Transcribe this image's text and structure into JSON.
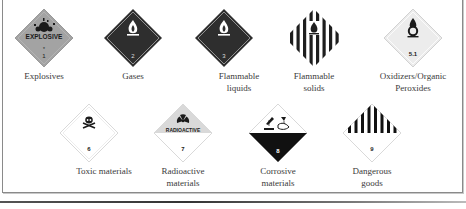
{
  "signs": [
    {
      "label": "Explosives",
      "class_number": "1",
      "text": "EXPLOSIVE",
      "color": "#9e9e9e"
    },
    {
      "label": "Gases",
      "class_number": "2",
      "color": "#2b2b2b"
    },
    {
      "label": "Flammable liquids",
      "class_number": "3",
      "color": "#2b2b2b"
    },
    {
      "label": "Flammable solids",
      "class_number": "4",
      "color": "#1e1e1e"
    },
    {
      "label": "Oxidizers/Organic Peroxides",
      "class_number": "5.1",
      "color": "#e6e6e6"
    },
    {
      "label": "Toxic materials",
      "class_number": "6",
      "color": "#ffffff"
    },
    {
      "label": "Radioactive materials",
      "class_number": "7",
      "text": "RADIOACTIVE",
      "color": "#d9d9d9"
    },
    {
      "label": "Corrosive materials",
      "class_number": "8",
      "color": "#111111"
    },
    {
      "label": "Dangerous goods",
      "class_number": "9",
      "color": "#111111"
    }
  ]
}
